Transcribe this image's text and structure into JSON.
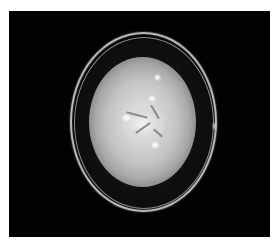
{
  "image": {
    "subject": "petri dish with fungal colony",
    "background_color": "#020202",
    "colony_color": "#d8d8d8",
    "dish_rim_color": "#b9b9b9"
  }
}
